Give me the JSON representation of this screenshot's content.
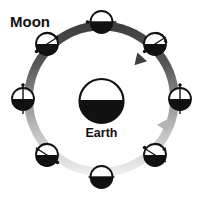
{
  "diagram": {
    "type": "moon-phase-orbit",
    "background_color": "#ffffff",
    "labels": {
      "moon": "Moon",
      "earth": "Earth"
    },
    "earth": {
      "name": "Earth",
      "center_x": 101.5,
      "center_y": 101,
      "radius": 22,
      "lit_half": "top",
      "lit_color": "#ffffff",
      "dark_color": "#111111",
      "outline_color": "#111111",
      "label_offset_y": 32
    },
    "orbit_ring": {
      "center_x": 101.5,
      "center_y": 99,
      "radius": 73,
      "stroke_width": 9,
      "gradient_top_color": "#4a4a4a",
      "gradient_bottom_color": "#e2e2e2",
      "direction": "counterclockwise",
      "arrowheads": [
        {
          "name": "top-arrowhead",
          "angle_deg": 60,
          "points_toward": "left"
        },
        {
          "name": "right-arrowhead",
          "angle_deg": -60,
          "points_toward": "up"
        }
      ]
    },
    "moons": [
      {
        "position_index": 0,
        "name": "moon-top",
        "angle_deg": 90,
        "center_x": 101.5,
        "center_y": 22,
        "radius": 11,
        "lit_half": "top",
        "axis_orientation": "horizontal",
        "marker_side": "left",
        "has_rotation_arrow": false
      },
      {
        "position_index": 1,
        "name": "moon-upper-right",
        "angle_deg": 45,
        "center_x": 155,
        "center_y": 44,
        "radius": 11,
        "lit_half": "top",
        "axis_orientation": "diagonal-nwse",
        "marker_side": "upper-right",
        "has_rotation_arrow": true
      },
      {
        "position_index": 2,
        "name": "moon-right",
        "angle_deg": 0,
        "center_x": 180,
        "center_y": 99,
        "radius": 11,
        "lit_half": "top",
        "axis_orientation": "vertical",
        "marker_side": "top",
        "has_rotation_arrow": false
      },
      {
        "position_index": 3,
        "name": "moon-lower-right",
        "angle_deg": -45,
        "center_x": 155,
        "center_y": 155,
        "radius": 11,
        "lit_half": "top",
        "axis_orientation": "diagonal-swne",
        "marker_side": "upper-right",
        "has_rotation_arrow": true
      },
      {
        "position_index": 4,
        "name": "moon-bottom",
        "angle_deg": -90,
        "center_x": 101.5,
        "center_y": 177,
        "radius": 11,
        "lit_half": "top",
        "axis_orientation": "horizontal",
        "marker_side": "none",
        "has_rotation_arrow": false
      },
      {
        "position_index": 5,
        "name": "moon-lower-left",
        "angle_deg": -135,
        "center_x": 47,
        "center_y": 155,
        "radius": 11,
        "lit_half": "top",
        "axis_orientation": "diagonal-nwse",
        "marker_side": "upper-left",
        "has_rotation_arrow": true
      },
      {
        "position_index": 6,
        "name": "moon-left",
        "angle_deg": 180,
        "center_x": 23,
        "center_y": 99,
        "radius": 11,
        "lit_half": "top",
        "axis_orientation": "vertical",
        "marker_side": "top",
        "has_rotation_arrow": false
      },
      {
        "position_index": 7,
        "name": "moon-upper-left",
        "angle_deg": 135,
        "center_x": 47,
        "center_y": 44,
        "radius": 11,
        "lit_half": "top",
        "axis_orientation": "diagonal-swne",
        "marker_side": "upper-right",
        "has_rotation_arrow": true
      }
    ],
    "moon_label_position": {
      "x": 10,
      "y": 27
    },
    "colors": {
      "lit": "#ffffff",
      "dark": "#111111",
      "outline": "#111111",
      "ring_dark": "#4a4a4a",
      "ring_light": "#e2e2e2",
      "text": "#111111"
    }
  }
}
